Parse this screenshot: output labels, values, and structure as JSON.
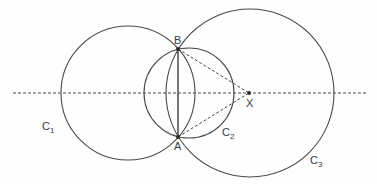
{
  "diagram": {
    "colors": {
      "stroke": "#4a4a4a",
      "dash": "#4a4a4a",
      "point": "#2a2a2a",
      "label": "#3a3a3a"
    },
    "circles": [
      {
        "id": "C1",
        "label": "C",
        "sub": "1",
        "cx": 128,
        "cy": 93,
        "r": 67,
        "label_x": 42,
        "label_y": 130
      },
      {
        "id": "C2",
        "label": "C",
        "sub": "2",
        "cx": 189,
        "cy": 93,
        "r": 45,
        "label_x": 222,
        "label_y": 136
      },
      {
        "id": "C3",
        "label": "C",
        "sub": "3",
        "cx": 250,
        "cy": 93,
        "r": 84,
        "label_x": 310,
        "label_y": 164
      }
    ],
    "points": [
      {
        "id": "B",
        "label": "B",
        "x": 178,
        "y": 49,
        "label_x": 174,
        "label_y": 44
      },
      {
        "id": "A",
        "label": "A",
        "x": 178,
        "y": 137,
        "label_x": 174,
        "label_y": 150
      },
      {
        "id": "X",
        "label": "X",
        "x": 249,
        "y": 93,
        "label_x": 246,
        "label_y": 107
      }
    ],
    "axis_line": {
      "x1": 13,
      "y1": 93,
      "x2": 366,
      "y2": 93,
      "style": "dashed"
    },
    "segments": [
      {
        "from": "A",
        "to": "B",
        "style": "solid"
      },
      {
        "from": "B",
        "to": "X",
        "style": "dashed"
      },
      {
        "from": "A",
        "to": "X",
        "style": "dashed"
      }
    ]
  }
}
